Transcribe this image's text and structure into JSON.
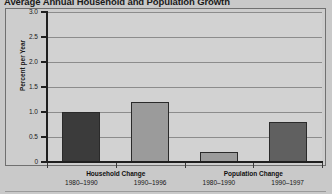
{
  "chart_data": {
    "type": "bar",
    "title": "Average Annual Household and Population Growth",
    "xlabel": "",
    "ylabel": "Percent per Year",
    "ylim": [
      0,
      3.0
    ],
    "ytick_labels": [
      "0",
      "0.5",
      "1.0",
      "1.5",
      "2.0",
      "2.5",
      "3.0"
    ],
    "ytick_values": [
      0,
      0.5,
      1.0,
      1.5,
      2.0,
      2.5,
      3.0
    ],
    "grid": true,
    "legend": "none",
    "groups": [
      {
        "name": "Household Change",
        "categories": [
          "1980–1990",
          "1990–1996"
        ],
        "values": [
          1.0,
          1.2
        ]
      },
      {
        "name": "Population Change",
        "categories": [
          "1980–1990",
          "1990–1997"
        ],
        "values": [
          0.2,
          0.8
        ]
      }
    ],
    "categories": [
      "1980–1990",
      "1990–1996",
      "1980–1990",
      "1990–1997"
    ],
    "values": [
      1.0,
      1.2,
      0.2,
      0.8
    ],
    "bar_colors": [
      "#3b3b3b",
      "#9b9b9b",
      "#9b9b9b",
      "#606060"
    ],
    "colors": {
      "dark_bar": "#3b3b3b",
      "light_bar": "#9b9b9b",
      "mid_bar": "#606060",
      "plot_background": "#d2d2d2",
      "figure_background": "#c9c9c9",
      "gridline": "#8c8c8c",
      "axis": "#1f1f1f"
    }
  }
}
